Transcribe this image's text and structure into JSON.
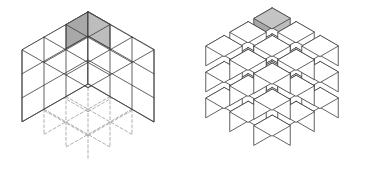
{
  "figure": {
    "title": "",
    "caption": "",
    "background_color": "#ffffff",
    "panels": [
      {
        "id": "assembled-cube",
        "name": "solid-3x3x3-cube",
        "label": "",
        "style": "assembled",
        "dimensions": {
          "nx": 3,
          "ny": 3,
          "nz": 3
        },
        "origin": {
          "x": 88,
          "y": 12
        },
        "unit": {
          "cell_w": 22,
          "cell_h": 12.6,
          "cell_v": 24
        },
        "gap": 0,
        "edges": {
          "visible_color": "#3a3a3a",
          "visible_width": 0.8,
          "hidden_color": "#8c8c8c",
          "hidden_width": 0.7,
          "hidden_dash": "3,2.2"
        },
        "faces": {
          "top_color": "#ffffff",
          "left_color": "#ffffff",
          "right_color": "#ffffff"
        },
        "highlight": {
          "cell": {
            "i": 0,
            "j": 0,
            "k": 0
          },
          "position_text": "top-front-left corner",
          "top_color": "#c4c4c4",
          "left_color": "#a8a8a8",
          "right_color": "#bdbdbd",
          "stroke_color": "#3a3a3a"
        }
      },
      {
        "id": "exploded-cube",
        "name": "exploded-3x3x3-cube",
        "label": "",
        "style": "exploded",
        "dimensions": {
          "nx": 3,
          "ny": 3,
          "nz": 3
        },
        "origin": {
          "x": 272,
          "y": 8
        },
        "unit": {
          "cell_w": 24,
          "cell_h": 13.8,
          "cell_v": 26
        },
        "cube_scale": 0.76,
        "gap": 0.24,
        "edges": {
          "visible_color": "#3a3a3a",
          "visible_width": 0.8,
          "hidden_color": "#8c8c8c",
          "hidden_width": 0.7,
          "hidden_dash": "3,2.2"
        },
        "faces": {
          "top_color": "#ffffff",
          "left_color": "#ffffff",
          "right_color": "#ffffff"
        },
        "highlight": {
          "cell": {
            "i": 0,
            "j": 0,
            "k": 0
          },
          "position_text": "top-front-left corner",
          "top_color": "#c4c4c4",
          "left_color": "#a8a8a8",
          "right_color": "#bdbdbd",
          "stroke_color": "#3a3a3a"
        }
      }
    ],
    "cube_count_total": 27,
    "highlighted_cube_count": 1
  }
}
